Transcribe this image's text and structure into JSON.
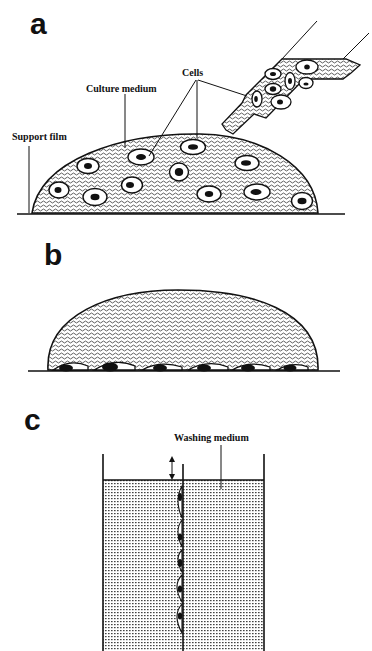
{
  "figure": {
    "panels": [
      {
        "letter": "a",
        "labels": {
          "cells": "Cells",
          "culture_medium": "Culture medium",
          "support_film": "Support film"
        }
      },
      {
        "letter": "b"
      },
      {
        "letter": "c",
        "labels": {
          "washing_medium": "Washing medium"
        }
      }
    ],
    "colors": {
      "ink": "#111111",
      "background": "#ffffff"
    }
  }
}
